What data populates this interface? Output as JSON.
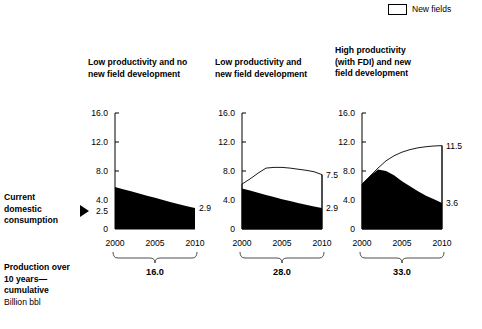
{
  "legend": {
    "items": [
      {
        "label": "New fields",
        "swatch": "white-with-black-border",
        "color": "#ffffff"
      }
    ]
  },
  "side_annotations": {
    "consumption_label": "Current\ndomestic\nconsumption",
    "consumption_value": 2.5,
    "pointer_icon": "triangle-right-icon",
    "production_label": "Production over\n10 years—\ncumulative",
    "unit_label": "Billion bbl"
  },
  "chart_data": {
    "type": "area",
    "title": "",
    "xlabel": "",
    "ylabel": "Billion bbl",
    "ylim": [
      0,
      16
    ],
    "xlim": [
      2000,
      2010
    ],
    "grid": false,
    "legend_position": "top-right",
    "ytick_labels": [
      "16.0",
      "12.0",
      "8.0",
      "4.0",
      "2.5",
      "0"
    ],
    "ytick_values": [
      16.0,
      12.0,
      8.0,
      4.0,
      2.5,
      0
    ],
    "xtick_labels": [
      "2000",
      "2005",
      "2010"
    ],
    "xtick_values": [
      2000,
      2005,
      2010
    ],
    "annotations": {
      "current_domestic_consumption": 2.5
    },
    "panels": [
      {
        "id": "panel-low-no-new",
        "title": "Low productivity and no\nnew field development",
        "ytick_labels": [
          "16.0",
          "12.0",
          "8.0",
          "4.0",
          "2.5",
          "0"
        ],
        "ytick_values": [
          16.0,
          12.0,
          8.0,
          4.0,
          2.5,
          0
        ],
        "x": [
          2000,
          2001,
          2002,
          2003,
          2004,
          2005,
          2006,
          2007,
          2008,
          2009,
          2010
        ],
        "series": [
          {
            "name": "Existing fields",
            "fill": "#000000",
            "values": [
              5.8,
              5.5,
              5.2,
              4.9,
              4.6,
              4.3,
              4.0,
              3.7,
              3.4,
              3.15,
              2.9
            ]
          }
        ],
        "end_labels": [
          {
            "text": "2.9",
            "value": 2.9
          }
        ],
        "cumulative_total": "16.0"
      },
      {
        "id": "panel-low-with-new",
        "title": "Low productivity and\nnew field development",
        "ytick_labels": [
          "16.0",
          "12.0",
          "8.0",
          "4.0",
          "0"
        ],
        "ytick_values": [
          16.0,
          12.0,
          8.0,
          4.0,
          0
        ],
        "x": [
          2000,
          2001,
          2002,
          2003,
          2004,
          2005,
          2006,
          2007,
          2008,
          2009,
          2010
        ],
        "series": [
          {
            "name": "Existing fields",
            "fill": "#000000",
            "values": [
              5.6,
              5.3,
              5.0,
              4.7,
              4.4,
              4.1,
              3.85,
              3.6,
              3.35,
              3.1,
              2.9
            ]
          },
          {
            "name": "New fields",
            "fill": "#ffffff",
            "values": [
              6.2,
              6.9,
              7.7,
              8.4,
              8.5,
              8.5,
              8.4,
              8.25,
              8.1,
              7.9,
              7.5
            ]
          }
        ],
        "end_labels": [
          {
            "text": "7.5",
            "value": 7.5
          },
          {
            "text": "2.9",
            "value": 2.9
          }
        ],
        "cumulative_total": "28.0"
      },
      {
        "id": "panel-high-fdi-new",
        "title": "High productivity\n(with FDI) and new\nfield development",
        "ytick_labels": [
          "16.0",
          "12.0",
          "8.0",
          "4.0",
          "0"
        ],
        "ytick_values": [
          16.0,
          12.0,
          8.0,
          4.0,
          0
        ],
        "x": [
          2000,
          2001,
          2002,
          2003,
          2004,
          2005,
          2006,
          2007,
          2008,
          2009,
          2010
        ],
        "series": [
          {
            "name": "Existing fields",
            "fill": "#000000",
            "values": [
              6.2,
              7.3,
              8.2,
              8.0,
              7.4,
              6.6,
              5.9,
              5.2,
              4.6,
              4.1,
              3.6
            ]
          },
          {
            "name": "New fields",
            "fill": "#ffffff",
            "values": [
              6.2,
              7.3,
              8.4,
              9.4,
              10.1,
              10.6,
              10.95,
              11.2,
              11.35,
              11.45,
              11.5
            ]
          }
        ],
        "end_labels": [
          {
            "text": "11.5",
            "value": 11.5
          },
          {
            "text": "3.6",
            "value": 3.6
          }
        ],
        "cumulative_total": "33.0"
      }
    ]
  }
}
